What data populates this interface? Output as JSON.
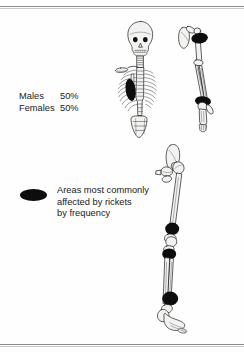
{
  "figure": {
    "background_color": "#fefefe",
    "rule_color": "#8d8d8d",
    "marker_color": "#0d0d0d",
    "bone_fill": "#f2f2f0",
    "bone_stroke": "#1c1c1c"
  },
  "stats": {
    "rows": [
      {
        "label": "Males",
        "value": "50%"
      },
      {
        "label": "Females",
        "value": "50%"
      }
    ]
  },
  "legend": {
    "swatch_name": "black-ellipse-marker",
    "lines": [
      "Areas most commonly",
      "affected by rickets",
      "by frequency"
    ]
  },
  "anatomy": {
    "figures": [
      {
        "name": "axial-skeleton",
        "parts": [
          "skull",
          "cervical-spine",
          "clavicle",
          "scapula",
          "ribcage",
          "sternum",
          "thoracic-spine",
          "lumbar-spine",
          "sacrum",
          "pelvis"
        ]
      },
      {
        "name": "upper-limb",
        "parts": [
          "scapula",
          "humerus",
          "radius",
          "ulna",
          "carpals",
          "metacarpals",
          "phalanges"
        ]
      },
      {
        "name": "lower-limb",
        "parts": [
          "pelvis",
          "femur",
          "patella",
          "tibia",
          "fibula",
          "tarsals",
          "metatarsals",
          "phalanges"
        ]
      }
    ],
    "affected_sites": [
      {
        "name": "rib-cage-marker",
        "region": "costochondral-junction"
      },
      {
        "name": "humeral-head-marker",
        "region": "proximal-humerus"
      },
      {
        "name": "distal-radius-marker",
        "region": "wrist"
      },
      {
        "name": "distal-femur-marker",
        "region": "knee-above"
      },
      {
        "name": "proximal-tibia-marker",
        "region": "knee-below"
      },
      {
        "name": "distal-tibia-marker",
        "region": "ankle"
      }
    ]
  }
}
